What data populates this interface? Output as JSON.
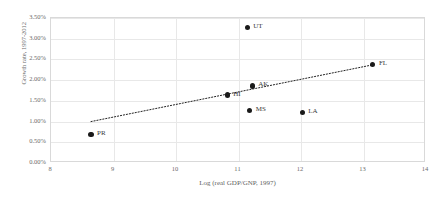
{
  "chart_data": {
    "type": "scatter",
    "title": "",
    "xlabel": "Log (real GDP/GNP, 1997)",
    "ylabel": "Growth rate, 1997-2012",
    "xlim": [
      8,
      14
    ],
    "ylim": [
      0,
      3.5
    ],
    "grid": true,
    "legend": "none",
    "xticks": [
      "8",
      "9",
      "10",
      "11",
      "12",
      "13",
      "14"
    ],
    "xtick_values": [
      8,
      9,
      10,
      11,
      12,
      13,
      14
    ],
    "yticks": [
      "0.00%",
      "0.50%",
      "1.00%",
      "1.50%",
      "2.00%",
      "2.50%",
      "3.00%",
      "3.50%"
    ],
    "ytick_values": [
      0.0,
      0.5,
      1.0,
      1.5,
      2.0,
      2.5,
      3.0,
      3.5
    ],
    "points": [
      {
        "label": "UT",
        "x": 11.14,
        "y": 3.28
      },
      {
        "label": "FL",
        "x": 13.15,
        "y": 2.37
      },
      {
        "label": "AK",
        "x": 11.22,
        "y": 1.86
      },
      {
        "label": "HI",
        "x": 10.82,
        "y": 1.64
      },
      {
        "label": "MS",
        "x": 11.18,
        "y": 1.26
      },
      {
        "label": "LA",
        "x": 12.02,
        "y": 1.21
      },
      {
        "label": "PR",
        "x": 8.64,
        "y": 0.68
      }
    ],
    "trendline": {
      "style": "dotted",
      "color": "#222222",
      "x_start": 8.64,
      "y_start": 1.0,
      "x_end": 13.15,
      "y_end": 2.37
    },
    "marker_color": "#1a1a1a",
    "grid_color": "#e8e8e8",
    "axis_color": "#d9d9d9"
  }
}
